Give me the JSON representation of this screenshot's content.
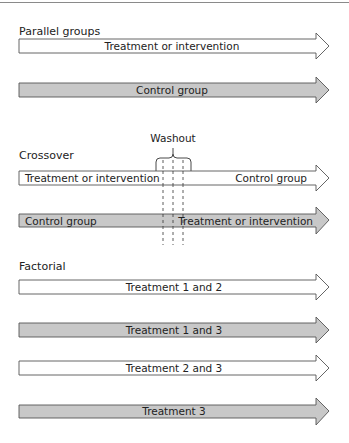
{
  "colors": {
    "filled_arrow": "#c8c8c8",
    "empty_arrow": "#ffffff",
    "stroke": "#555555",
    "text": "#222222"
  },
  "sections": [
    {
      "title": "Parallel groups",
      "arrows": [
        {
          "fill": "white",
          "labels": [
            "Treatment or intervention"
          ]
        },
        {
          "fill": "gray",
          "labels": [
            "Control group"
          ]
        }
      ]
    },
    {
      "title": "Crossover",
      "washout_label": "Washout",
      "arrows": [
        {
          "fill": "white",
          "labels": [
            "Treatment or intervention",
            "Control group"
          ]
        },
        {
          "fill": "gray",
          "labels": [
            "Control group",
            "Treatment or intervention"
          ]
        }
      ]
    },
    {
      "title": "Factorial",
      "arrows": [
        {
          "fill": "white",
          "labels": [
            "Treatment 1 and 2"
          ]
        },
        {
          "fill": "gray",
          "labels": [
            "Treatment 1 and 3"
          ]
        },
        {
          "fill": "white",
          "labels": [
            "Treatment 2 and 3"
          ]
        },
        {
          "fill": "gray",
          "labels": [
            "Treatment 3"
          ]
        }
      ]
    }
  ]
}
